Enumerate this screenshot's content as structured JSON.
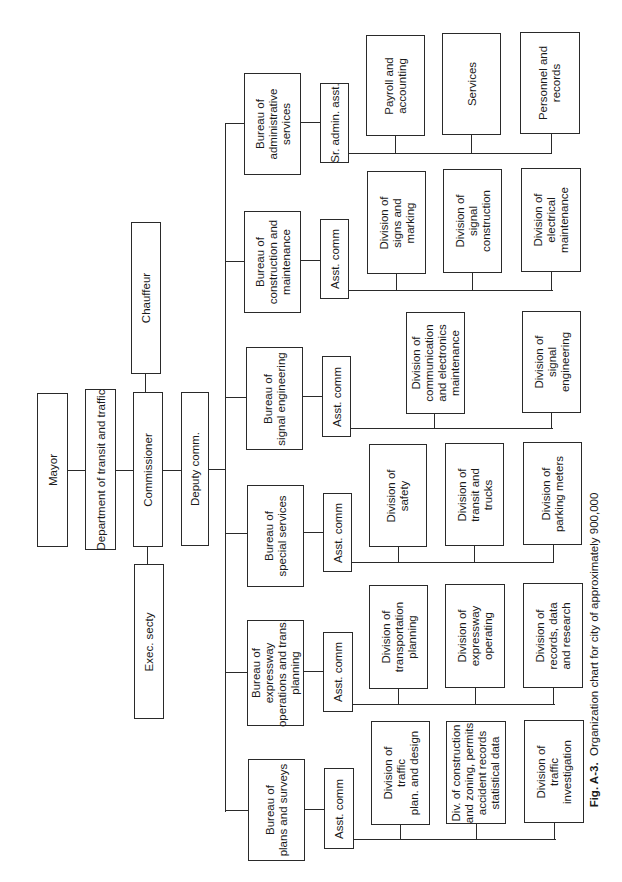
{
  "caption": {
    "label": "Fig. A-3.",
    "text": "Organization chart for city of approximately 900,000"
  },
  "top": {
    "mayor": "Mayor",
    "department": "Department of transit and traffic",
    "commissioner": "Commissioner",
    "chauffeur": "Chauffeur",
    "exec_secty": "Exec. secty",
    "deputy": "Deputy comm."
  },
  "bureaus": [
    {
      "name": "Bureau of\nadministrative\nservices",
      "assistant": "Sr. admin. asst.",
      "divisions": [
        "Payroll and\naccounting",
        "Services",
        "Personnel and\nrecords"
      ]
    },
    {
      "name": "Bureau of\nconstruction and\nmaintenance",
      "assistant": "Asst. comm",
      "divisions": [
        "Division of\nsigns and\nmarking",
        "Division of\nsignal\nconstruction",
        "Division of\nelectrical\nmaintenance"
      ]
    },
    {
      "name": "Bureau of\nsignal engineering",
      "assistant": "Asst. comm",
      "divisions": [
        "Division of\ncommunication\nand electronics\nmaintenance",
        "Division of\nsignal\nengineering"
      ]
    },
    {
      "name": "Bureau of\nspecial services",
      "assistant": "Asst. comm",
      "divisions": [
        "Division of\nsafety",
        "Division of\ntransit and\ntrucks",
        "Division of\nparking meters"
      ]
    },
    {
      "name": "Bureau of\nexpressway\noperations and trans.\nplanning",
      "assistant": "Asst. comm",
      "divisions": [
        "Division of\ntransportation\nplanning",
        "Division of\nexpressway\noperating",
        "Division of\nrecords, data\nand research"
      ]
    },
    {
      "name": "Bureau of\nplans and surveys",
      "assistant": "Asst. comm",
      "divisions": [
        "Division of\ntraffic\nplan. and design",
        "Div. of construction\nand zoning, permits\naccident records\nstatistical data",
        "Division of\ntraffic\ninvestigation"
      ]
    }
  ]
}
